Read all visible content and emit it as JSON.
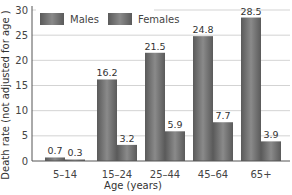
{
  "chart_data": {
    "type": "bar",
    "title": "",
    "xlabel": "Age (years)",
    "ylabel": "Death rate (not adjusted for age )",
    "ylim": [
      0,
      30
    ],
    "yticks": [
      0,
      5,
      10,
      15,
      20,
      25,
      30
    ],
    "grid": true,
    "legend_position": "top-left inside",
    "categories": [
      "5–14",
      "15–24",
      "25–44",
      "45–64",
      "65+"
    ],
    "series": [
      {
        "name": "Males",
        "values": [
          0.7,
          16.2,
          21.5,
          24.8,
          28.5
        ],
        "color": "#6e6e6e"
      },
      {
        "name": "Females",
        "values": [
          0.3,
          3.2,
          5.9,
          7.7,
          3.9
        ],
        "color": "#7a7a7a"
      }
    ],
    "data_labels": true
  }
}
